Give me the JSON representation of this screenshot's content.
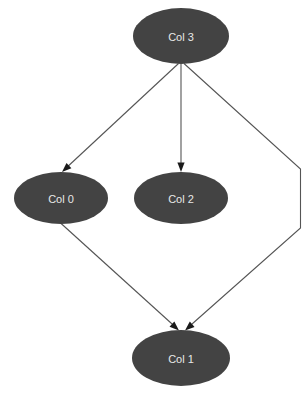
{
  "diagram": {
    "type": "directed-graph",
    "background_color": "#ffffff",
    "node_fill_color": "#434343",
    "node_label_color": "#e8e8e8",
    "edge_color": "#555555",
    "arrowhead_color": "#1a1a1a",
    "nodes": [
      {
        "id": "col3",
        "label": "Col 3",
        "cx": 181,
        "cy": 36,
        "rx": 48,
        "ry": 28
      },
      {
        "id": "col0",
        "label": "Col 0",
        "cx": 61,
        "cy": 198,
        "rx": 47,
        "ry": 26
      },
      {
        "id": "col2",
        "label": "Col 2",
        "cx": 181,
        "cy": 198,
        "rx": 47,
        "ry": 26
      },
      {
        "id": "col1",
        "label": "Col 1",
        "cx": 181,
        "cy": 358,
        "rx": 49,
        "ry": 28
      }
    ],
    "edges": [
      {
        "id": "edge-col3-col0",
        "from": "col3",
        "to": "col0",
        "path": "M 178.5,63.5 L 64.5,169.5",
        "arrow_at": {
          "x": 62,
          "y": 172,
          "angle": 137
        }
      },
      {
        "id": "edge-col3-col2",
        "from": "col3",
        "to": "col2",
        "path": "M 181,64 L 181,168.5",
        "arrow_at": {
          "x": 181,
          "y": 172,
          "angle": 90
        }
      },
      {
        "id": "edge-col3-col1",
        "from": "col3",
        "to": "col1",
        "path": "M 184,63.5 L 300.5,169 L 300.5,228 L 187.5,328",
        "arrow_at": {
          "x": 185,
          "y": 330.5,
          "angle": 139
        }
      },
      {
        "id": "edge-col0-col1",
        "from": "col0",
        "to": "col1",
        "path": "M 60,222.5 L 176.5,328",
        "arrow_at": {
          "x": 179,
          "y": 330.5,
          "angle": 42
        }
      }
    ]
  }
}
